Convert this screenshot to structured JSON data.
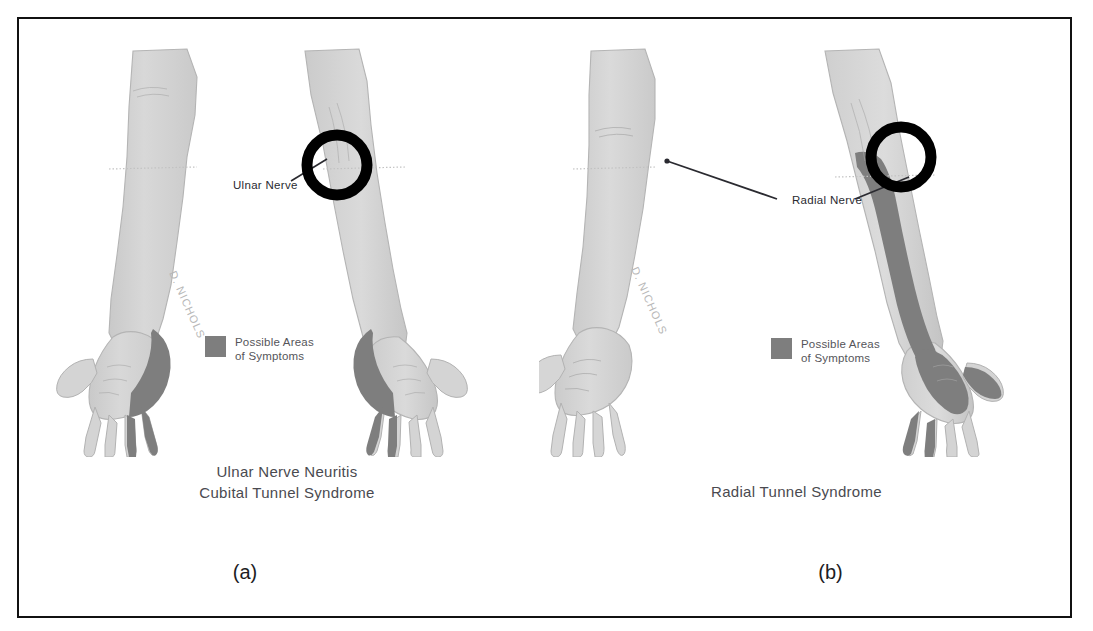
{
  "figure": {
    "background_color": "#ffffff",
    "border_color": "#111111",
    "skin_color": "#d2d2d2",
    "symptom_color": "#7e7e7e",
    "marker_color": "#000000",
    "leader_color": "#2a2a30"
  },
  "panels": [
    {
      "id": "a",
      "label": "(a)",
      "caption": "Ulnar Nerve Neuritis\nCubital Tunnel Syndrome",
      "nerve_label": "Ulnar Nerve",
      "legend": {
        "text": "Possible Areas\nof Symptoms",
        "swatch_color": "#7e7e7e"
      },
      "artist_signature": "D. NICHOLS",
      "marker": {
        "shape": "circle-outline",
        "location": "medial elbow"
      },
      "arms": [
        {
          "side": "left",
          "view": "palm-up",
          "shaded": "ulnar border of hand, ring and little finger"
        },
        {
          "side": "right",
          "view": "palm-up",
          "shaded": "ulnar border of hand, ring and little finger"
        }
      ]
    },
    {
      "id": "b",
      "label": "(b)",
      "caption": "Radial Tunnel Syndrome",
      "nerve_label": "Radial Nerve",
      "legend": {
        "text": "Possible Areas\nof Symptoms",
        "swatch_color": "#7e7e7e"
      },
      "artist_signature": "D. NICHOLS",
      "marker": {
        "shape": "circle-outline",
        "location": "lateral elbow"
      },
      "arms": [
        {
          "side": "left",
          "view": "palm-up",
          "shaded": "none"
        },
        {
          "side": "right",
          "view": "dorsal",
          "shaded": "dorsal radial forearm extending to thumb and dorsum of hand"
        }
      ]
    }
  ]
}
